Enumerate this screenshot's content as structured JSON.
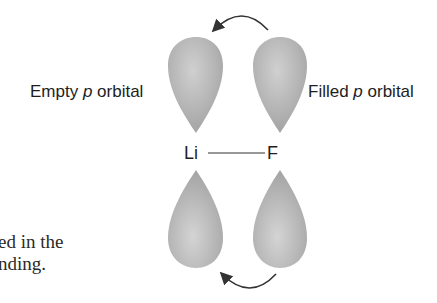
{
  "diagram": {
    "left_label": {
      "prefix": "Empty ",
      "italic": "p",
      "suffix": " orbital"
    },
    "right_label": {
      "prefix": "Filled ",
      "italic": "p",
      "suffix": " orbital"
    },
    "atoms": {
      "left": "Li",
      "right": "F"
    },
    "bond": "single",
    "arrows": [
      {
        "from": "top-right-lobe",
        "to": "top-left-lobe",
        "direction": "right-to-left"
      },
      {
        "from": "bottom-right-lobe",
        "to": "bottom-left-lobe",
        "direction": "right-to-left"
      }
    ],
    "colors": {
      "lobe": "#a8a8a8",
      "lobe_highlight": "#d2d2d2",
      "arrow": "#333333",
      "text": "#1e1e1e"
    }
  },
  "caption": {
    "line1": "ed in the",
    "line2": "nding."
  }
}
